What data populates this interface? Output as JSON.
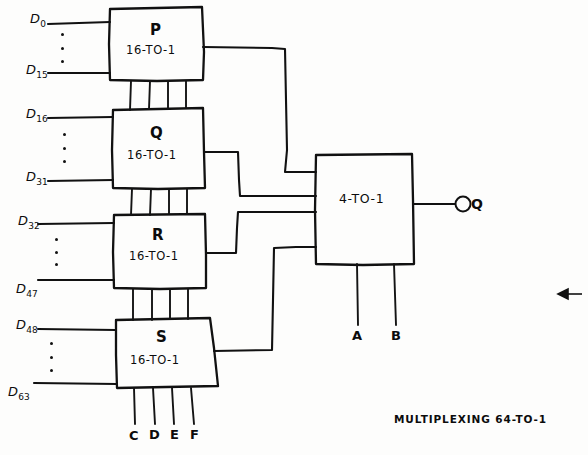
{
  "figure": {
    "caption": "MULTIPLEXING 64-TO-1",
    "background_color": "#fdfdfc",
    "ink_color": "#111111",
    "annotation_arrow": "left-arrow"
  },
  "stage1": {
    "subtitle": "16-TO-1",
    "blocks": [
      {
        "name": "P",
        "subtitle": "16-TO-1",
        "input_first": "D",
        "input_first_sub": "0",
        "input_last": "D",
        "input_last_sub": "15"
      },
      {
        "name": "Q",
        "subtitle": "16-TO-1",
        "input_first": "D",
        "input_first_sub": "16",
        "input_last": "D",
        "input_last_sub": "31"
      },
      {
        "name": "R",
        "subtitle": "16-TO-1",
        "input_first": "D",
        "input_first_sub": "32",
        "input_last": "D",
        "input_last_sub": "47"
      },
      {
        "name": "S",
        "subtitle": "16-TO-1",
        "input_first": "D",
        "input_first_sub": "48",
        "input_last": "D",
        "input_last_sub": "63"
      }
    ],
    "select_lines": [
      "C",
      "D",
      "E",
      "F"
    ]
  },
  "stage2": {
    "name": "4-TO-1",
    "output": "Q",
    "select_lines": [
      "A",
      "B"
    ]
  }
}
